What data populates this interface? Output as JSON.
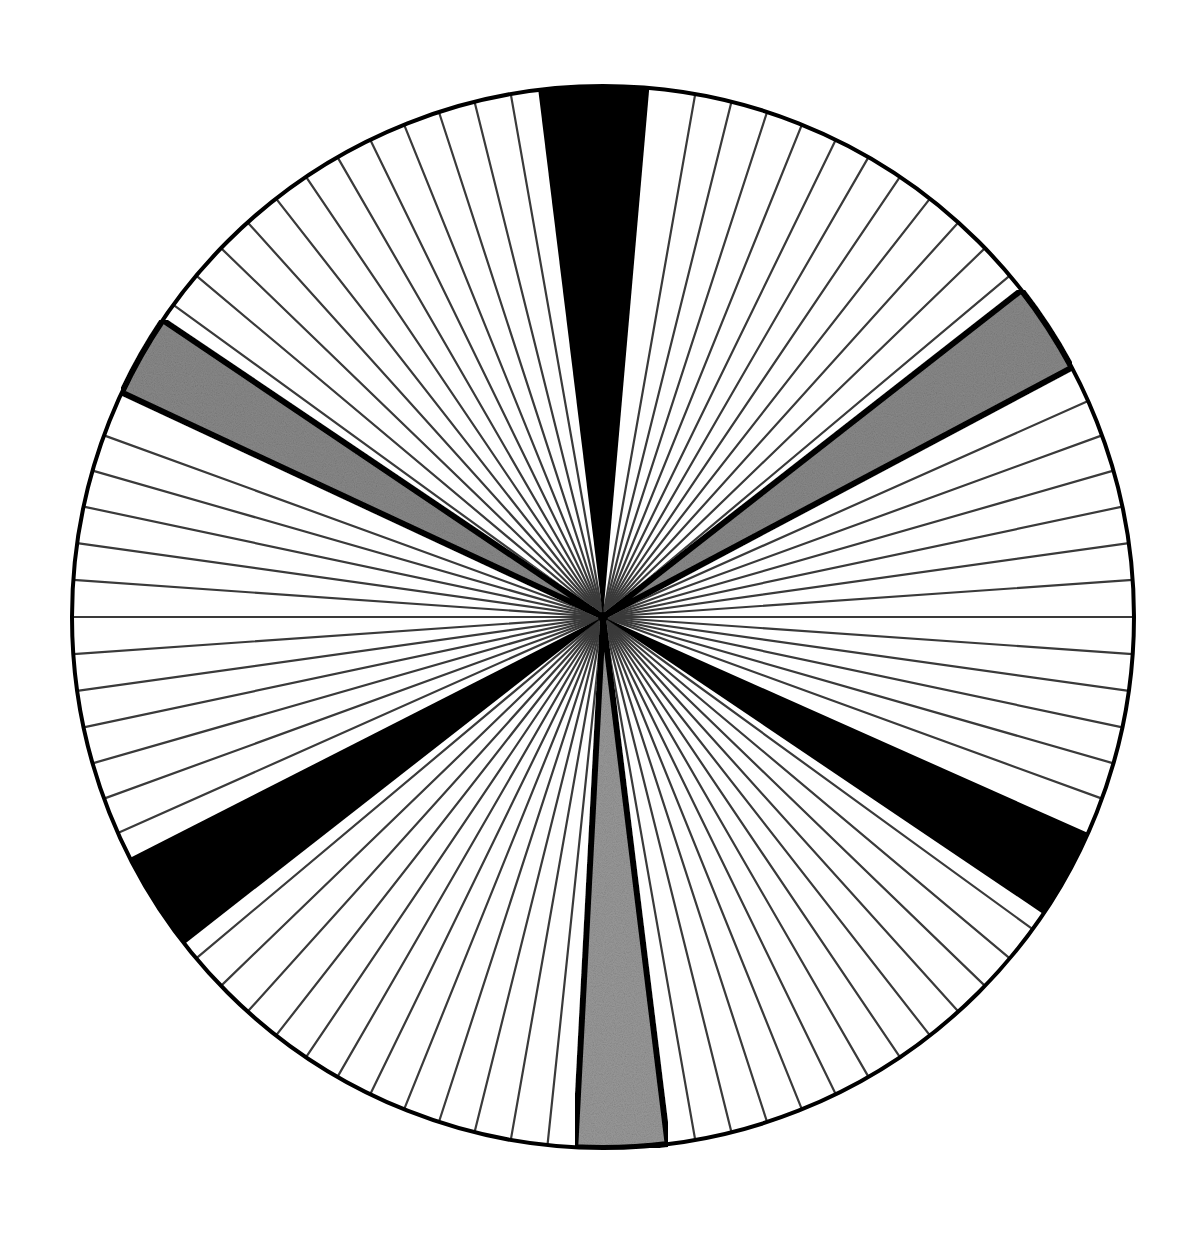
{
  "figure": {
    "type": "radial-wedge-diagram",
    "center": [
      603,
      617
    ],
    "radius": 531,
    "outline_color": "#000000",
    "background_color": "#ffffff",
    "line_spacing_deg": 4,
    "thin_line_color": "#3a3a3a",
    "wedges": [
      {
        "name": "black-wedge-top",
        "fill": "#000000",
        "start_deg": 263,
        "end_deg": 275,
        "border": false
      },
      {
        "name": "black-wedge-lower-right",
        "fill": "#000000",
        "start_deg": 24,
        "end_deg": 34,
        "border": false
      },
      {
        "name": "black-wedge-lower-left",
        "fill": "#000000",
        "start_deg": 142,
        "end_deg": 153,
        "border": false
      },
      {
        "name": "gray-wedge-upper-right",
        "fill": "#8a8a8a",
        "start_deg": 322,
        "end_deg": 332,
        "border": true
      },
      {
        "name": "gray-wedge-upper-left",
        "fill": "#8a8a8a",
        "start_deg": 205,
        "end_deg": 214,
        "border": true
      },
      {
        "name": "gray-wedge-bottom",
        "fill": "#9a9a9a",
        "start_deg": 83,
        "end_deg": 93,
        "border": true
      }
    ]
  }
}
